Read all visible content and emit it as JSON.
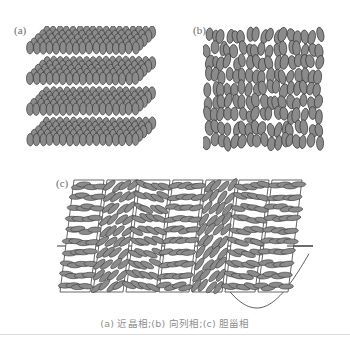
{
  "figure": {
    "caption": "(a) 近晶相;(b) 向列相;(c) 胆甾相",
    "width": 350,
    "height": 347,
    "background": "#ffffff"
  },
  "panels": [
    {
      "id": "a",
      "label": "(a)",
      "phase_name": "近晶相",
      "phase_name_en": "smectic phase",
      "description": "Four stacked horizontal layers of vertically aligned ellipsoidal molecules drawn in 3D perspective.",
      "layer_count": 4,
      "molecules_per_row": 17,
      "rows_per_layer": 5
    },
    {
      "id": "b",
      "label": "(b)",
      "phase_name": "向列相",
      "phase_name_en": "nematic phase",
      "description": "Vertically oriented ellipsoidal molecules with orientational order but no positional order.",
      "columns": 17,
      "rows": 9
    },
    {
      "id": "c",
      "label": "(c)",
      "phase_name": "胆甾相",
      "phase_name_en": "cholesteric phase",
      "description": "Seven stacked tilted planes, each containing ellipsoids rotated progressively, traversed by a helical sinusoid and a horizontal director axis.",
      "plane_count": 7,
      "plane_rotations_deg": [
        90,
        50,
        115,
        80,
        40,
        105,
        85
      ],
      "has_helix_curve": true,
      "has_axis_line": true
    }
  ],
  "colors": {
    "molecule_fill": "#8b8b8b",
    "molecule_stroke": "#3a3a3a",
    "plane_stroke": "#555555",
    "helix_stroke": "#4a4a4a",
    "axis_stroke": "#3c3c3c",
    "label_text": "#6a6a6a",
    "caption_text": "#8e8e8e",
    "rule": "#dcdcdc"
  }
}
